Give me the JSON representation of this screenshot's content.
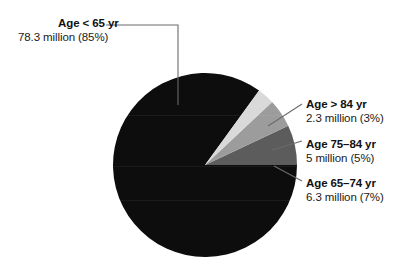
{
  "chart_data": {
    "type": "pie",
    "title": "",
    "subtitle": "",
    "xlabel": "",
    "ylabel": "",
    "legend_position": "callout-labels",
    "grid": false,
    "units": "million people",
    "total_percent": 100,
    "start_angle_deg": 0,
    "direction": "counterclockwise",
    "categories": [
      "Age < 65 yr",
      "Age 65–74 yr",
      "Age 75–84 yr",
      "Age > 84 yr"
    ],
    "values": [
      85,
      7,
      5,
      3
    ],
    "counts_millions": [
      78.3,
      6.3,
      5,
      2.3
    ],
    "colors": [
      "#0d0d0d",
      "#5c5c5c",
      "#9c9c9c",
      "#d9d9d9"
    ],
    "slices": [
      {
        "label": "Age < 65 yr",
        "value_text": "78.3 million (85%)",
        "count": 78.3,
        "percent": 85,
        "color": "#0d0d0d"
      },
      {
        "label": "Age 65–74 yr",
        "value_text": "6.3 million (7%)",
        "count": 6.3,
        "percent": 7,
        "color": "#5c5c5c"
      },
      {
        "label": "Age 75–84 yr",
        "value_text": "5 million (5%)",
        "count": 5,
        "percent": 5,
        "color": "#9c9c9c"
      },
      {
        "label": "Age > 84 yr",
        "value_text": "2.3 million (3%)",
        "count": 2.3,
        "percent": 3,
        "color": "#d9d9d9"
      }
    ]
  },
  "callouts": {
    "under_65": {
      "title": "Age < 65 yr",
      "value": "78.3 million (85%)"
    },
    "over_84": {
      "title": "Age > 84 yr",
      "value": "2.3 million (3%)"
    },
    "age_75_84": {
      "title": "Age 75–84 yr",
      "value": "5 million (5%)"
    },
    "age_65_74": {
      "title": "Age 65–74 yr",
      "value": "6.3 million (7%)"
    }
  },
  "style": {
    "background": "#ffffff",
    "leader_line_color": "#6b6b6b",
    "text_color": "#111111"
  }
}
